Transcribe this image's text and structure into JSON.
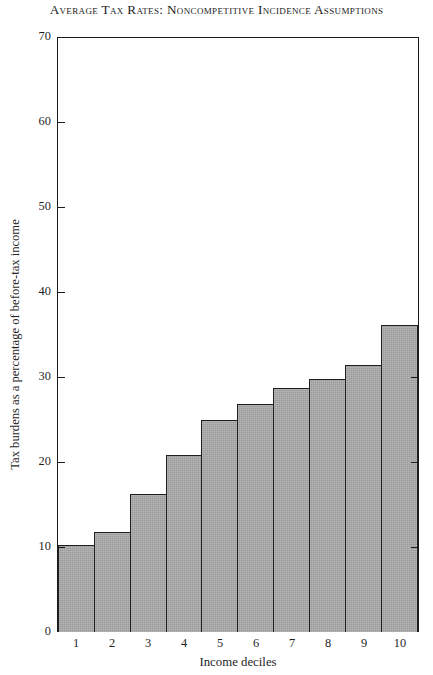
{
  "chart_data": {
    "type": "bar",
    "title": "Average Tax Rates:  Noncompetitive Incidence Assumptions",
    "xlabel": "Income deciles",
    "ylabel": "Tax burdens as a percentage of before-tax income",
    "categories": [
      "1",
      "2",
      "3",
      "4",
      "5",
      "6",
      "7",
      "8",
      "9",
      "10"
    ],
    "values": [
      10.2,
      11.8,
      16.3,
      20.9,
      25.0,
      26.9,
      28.7,
      29.8,
      31.5,
      36.2
    ],
    "ylim": [
      0,
      70
    ],
    "yticks": [
      0,
      10,
      20,
      30,
      40,
      50,
      60,
      70
    ],
    "ytick_labels": [
      "0",
      "10",
      "20",
      "30",
      "40",
      "50",
      "60",
      "70"
    ],
    "grid": false,
    "legend": null,
    "bar_fill_color": "#a9a9a9",
    "bar_edge_color": "#1f1f1f",
    "axis_color": "#1a1a1a",
    "background_color": "#ffffff",
    "bar_gap": 0,
    "right_axis_ticks": [
      10,
      20,
      30
    ]
  }
}
